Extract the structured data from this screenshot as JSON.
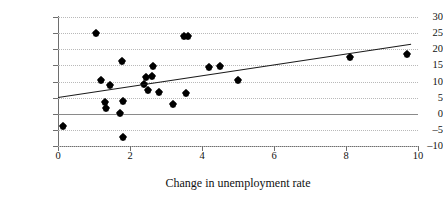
{
  "chart_data": {
    "type": "scatter",
    "title": "",
    "xlabel": "Change in unemployment rate",
    "ylabel": "%Δ unit labour costs",
    "xlim": [
      0,
      10
    ],
    "ylim": [
      -10,
      30
    ],
    "xticks": [
      0,
      2,
      4,
      6,
      8,
      10
    ],
    "yticks": [
      -10,
      -5,
      0,
      5,
      10,
      15,
      20,
      25,
      30
    ],
    "xtick_labels": [
      "0",
      "2",
      "4",
      "6",
      "8",
      "10"
    ],
    "ytick_labels": [
      "–10",
      "–5",
      "0",
      "5",
      "10",
      "15",
      "20",
      "25",
      "30"
    ],
    "grid": "horizontal-dotted",
    "legend": "none",
    "marker": "filled-diamond",
    "marker_color": "#000000",
    "points": [
      {
        "x": 0.15,
        "y": -3.7
      },
      {
        "x": 1.05,
        "y": 24.9
      },
      {
        "x": 1.2,
        "y": 10.5
      },
      {
        "x": 1.3,
        "y": 3.5
      },
      {
        "x": 1.32,
        "y": 1.8
      },
      {
        "x": 1.45,
        "y": 8.8
      },
      {
        "x": 1.72,
        "y": 0.2
      },
      {
        "x": 1.78,
        "y": 16.4
      },
      {
        "x": 1.8,
        "y": 4.1
      },
      {
        "x": 1.8,
        "y": -7.2
      },
      {
        "x": 2.4,
        "y": 9.1
      },
      {
        "x": 2.45,
        "y": 11.3
      },
      {
        "x": 2.5,
        "y": 7.5
      },
      {
        "x": 2.6,
        "y": 11.6
      },
      {
        "x": 2.65,
        "y": 14.7
      },
      {
        "x": 2.8,
        "y": 6.6
      },
      {
        "x": 3.2,
        "y": 2.9
      },
      {
        "x": 3.5,
        "y": 24.1
      },
      {
        "x": 3.6,
        "y": 24.2
      },
      {
        "x": 3.55,
        "y": 6.3
      },
      {
        "x": 4.2,
        "y": 14.5
      },
      {
        "x": 4.5,
        "y": 14.9
      },
      {
        "x": 5.0,
        "y": 10.4
      },
      {
        "x": 8.1,
        "y": 17.6
      },
      {
        "x": 9.7,
        "y": 18.4
      }
    ],
    "trend_line": {
      "x0": 0.0,
      "y0": 5.2,
      "x1": 9.8,
      "y1": 21.7,
      "color": "#1a1a1a"
    }
  }
}
